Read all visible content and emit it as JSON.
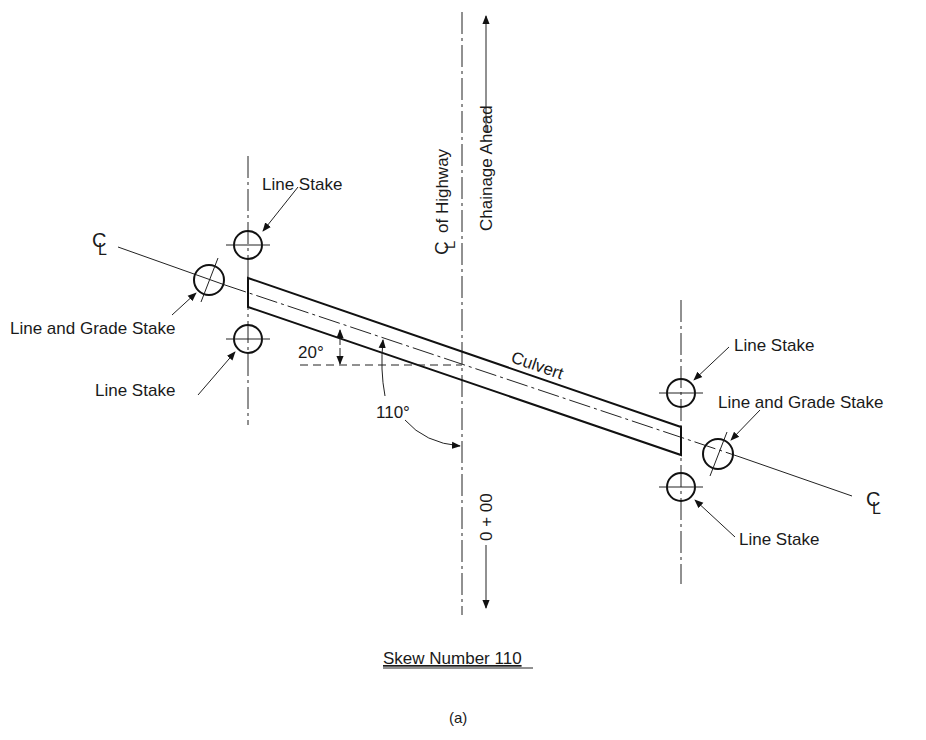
{
  "diagram": {
    "title": "Skew Number 110",
    "caption": "(a)",
    "highway_centerline_label": "of Highway",
    "centerline_symbol": "CL",
    "chainage_ahead_label": "Chainage Ahead",
    "station_label": "0 + 00",
    "culvert_label": "Culvert",
    "angle_small": "20°",
    "angle_skew": "110°",
    "stakes": {
      "left_top": "Line Stake",
      "left_grade": "Line and Grade Stake",
      "left_bottom": "Line Stake",
      "right_top": "Line Stake",
      "right_grade": "Line and Grade Stake",
      "right_bottom": "Line Stake"
    },
    "colors": {
      "ink": "#111111",
      "background": "#ffffff"
    }
  }
}
